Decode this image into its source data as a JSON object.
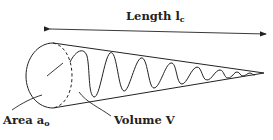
{
  "diagram": {
    "title_label": {
      "main": "Length l",
      "sub": "c"
    },
    "area_label": {
      "main": "Area a",
      "sub": "o"
    },
    "volume_label": {
      "main": "Volume V"
    },
    "stroke_color": "#222222",
    "shape": "cone with oscillating wave inside, cylinder cross-section at base"
  }
}
